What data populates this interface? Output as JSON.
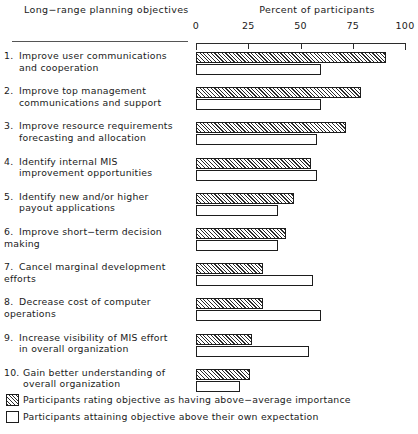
{
  "header": {
    "left_title": "Long−range planning objectives",
    "right_title": "Percent of participants"
  },
  "legend": {
    "items": [
      {
        "swatch": "hatched",
        "label": "Participants rating objective as having above−average importance"
      },
      {
        "swatch": "open",
        "label": "Participants attaining objective above their own expectation"
      }
    ]
  },
  "chart_data": {
    "type": "bar",
    "orientation": "horizontal",
    "title": "",
    "xlabel": "Percent of participants",
    "ylabel": "Long−range planning objectives",
    "xlim": [
      0,
      100
    ],
    "xticks": [
      0,
      25,
      50,
      75,
      100
    ],
    "xticklabels": [
      "0",
      "25",
      "50",
      "75",
      "100"
    ],
    "grid": false,
    "legend_position": "bottom-left",
    "categories": [
      {
        "number": "1.",
        "line1": "Improve user communications",
        "line2": "and cooperation"
      },
      {
        "number": "2.",
        "line1": "Improve top management",
        "line2": "communications and support"
      },
      {
        "number": "3.",
        "line1": "Improve resource requirements",
        "line2": "forecasting and allocation"
      },
      {
        "number": "4.",
        "line1": "Identify internal MIS",
        "line2": "improvement opportunities"
      },
      {
        "number": "5.",
        "line1": "Identify new and/or higher",
        "line2": "payout applications"
      },
      {
        "number": "6.",
        "line1": "Improve short−term decision making",
        "line2": ""
      },
      {
        "number": "7.",
        "line1": "Cancel marginal development efforts",
        "line2": ""
      },
      {
        "number": "8.",
        "line1": "Decrease cost of computer operations",
        "line2": ""
      },
      {
        "number": "9.",
        "line1": "Increase visibility of MIS effort",
        "line2": "in overall organization"
      },
      {
        "number": "10.",
        "line1": "Gain better understanding of",
        "line2": "overall organization"
      }
    ],
    "series": [
      {
        "name": "Participants rating objective as having above−average importance",
        "style": "hatched",
        "values": [
          91,
          79,
          72,
          55,
          47,
          43,
          32,
          32,
          27,
          26
        ]
      },
      {
        "name": "Participants attaining objective above their own expectation",
        "style": "open",
        "values": [
          60,
          60,
          58,
          58,
          39,
          39,
          56,
          60,
          54,
          21
        ]
      }
    ]
  }
}
